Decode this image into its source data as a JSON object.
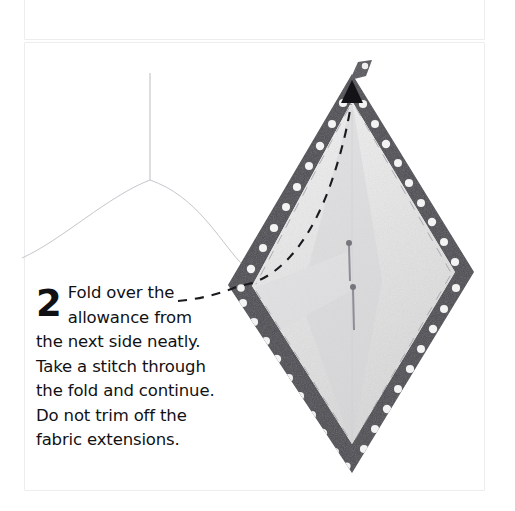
{
  "page": {
    "background_color": "#ffffff",
    "panel_border_color": "#ededef"
  },
  "previous_panel": {
    "name": "step-1-panel-cropped",
    "visible_fragment": "dark fabric corner artifact"
  },
  "step_panel": {
    "step_number": "2",
    "instruction_text": "Fold over the allowance from the next side neatly. Take a stitch through the fold and continue. Do not trim off the fabric extensions.",
    "instruction_lines": [
      "Fold over the",
      "allowance from",
      "the next side neatly.",
      "Take a stitch through",
      "the fold and continue.",
      "Do not trim off the",
      "fabric extensions."
    ],
    "text_color": "#111114"
  },
  "illustration": {
    "subject": "diamond patchwork piece with polka-dot binding",
    "shape": "diamond",
    "binding_color": "#4a4a50",
    "binding_dot_color": "#f4f4f4",
    "fabric_color": "#ededee",
    "fabric_shadow_color": "#dcdcdd",
    "thread_color": "#b9b9bf",
    "arrow_color": "#141418",
    "dashed_guide_color": "#1b1b1f",
    "vertices": {
      "top": "352,78",
      "right": "468,272",
      "bottom": "352,468",
      "left": "233,285"
    },
    "annotations": [
      {
        "name": "fold-direction-arrow",
        "label": "arrow pointing to top corner"
      },
      {
        "name": "stitch-path-dashed-line",
        "label": "dashed stitching path"
      },
      {
        "name": "pin-upper",
        "label": "pin in upper fabric"
      },
      {
        "name": "pin-lower",
        "label": "pin in lower fabric"
      },
      {
        "name": "hanging-thread",
        "label": "loose thread above piece"
      },
      {
        "name": "fabric-extension-tab",
        "label": "untrimmed fabric extension at top corner"
      }
    ]
  }
}
